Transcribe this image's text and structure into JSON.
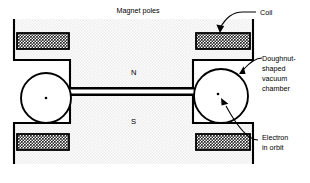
{
  "figure": {
    "title_label": "Magnet poles",
    "pole_north_label": "N",
    "pole_south_label": "S",
    "callouts": {
      "coil": "Coil",
      "chamber_line1": "Doughnut-",
      "chamber_line2": "shaped",
      "chamber_line3": "vacuum",
      "chamber_line4": "chamber",
      "electron_line1": "Electron",
      "electron_line2": "in orbit"
    },
    "colors": {
      "ink": "#000000",
      "paper": "#ffffff",
      "magnet_fill": "#efefef",
      "coil_fill": "#d9d9d9"
    }
  }
}
